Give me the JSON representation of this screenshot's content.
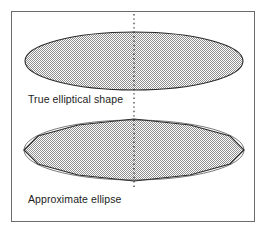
{
  "figure": {
    "background_color": "#ffffff",
    "frame": {
      "border_color": "#6b6b6b",
      "fill_color": "#ffffff"
    },
    "centerline": {
      "style": "dotted",
      "color": "#1c1c1c",
      "orientation": "vertical",
      "x": 134,
      "y_start": 14,
      "y_end": 190
    },
    "shapes": [
      {
        "name": "true-ellipse",
        "kind": "ellipse",
        "outline_color": "#2a2a2a",
        "fill_pattern": "checkerboard-dither-gray",
        "fill_color": "#b0b0b0",
        "cx": 134,
        "cy": 61,
        "rx": 109,
        "ry": 29
      },
      {
        "name": "approximate-ellipse",
        "kind": "polygon",
        "outline_color": "#2a2a2a",
        "fill_pattern": "checkerboard-dither-gray",
        "fill_color": "#b0b0b0",
        "vertex_count": 12,
        "cx": 134,
        "cy": 150,
        "rx": 110,
        "ry": 30
      }
    ],
    "captions": {
      "true_label": "True elliptical shape",
      "approximate_label": "Approximate ellipse"
    }
  },
  "chart_data": {
    "type": "diagram",
    "title": "",
    "subtitle": "",
    "xlabel": "",
    "ylabel": "",
    "legend_position": "none",
    "grid": false,
    "annotations": [
      "True elliptical shape",
      "Approximate ellipse"
    ],
    "series": [
      {
        "name": "True elliptical shape",
        "shape": "ellipse",
        "center": [
          134,
          61
        ],
        "semi_axes": [
          109,
          29
        ],
        "vertices": null
      },
      {
        "name": "Approximate ellipse",
        "shape": "polygon",
        "center": [
          134,
          150
        ],
        "semi_axes": [
          110,
          30
        ],
        "vertices": [
          [
            134,
            119
          ],
          [
            190,
            125
          ],
          [
            230,
            136
          ],
          [
            244,
            150
          ],
          [
            230,
            164
          ],
          [
            190,
            175
          ],
          [
            134,
            181
          ],
          [
            78,
            175
          ],
          [
            38,
            164
          ],
          [
            24,
            150
          ],
          [
            38,
            136
          ],
          [
            78,
            125
          ]
        ]
      }
    ]
  }
}
